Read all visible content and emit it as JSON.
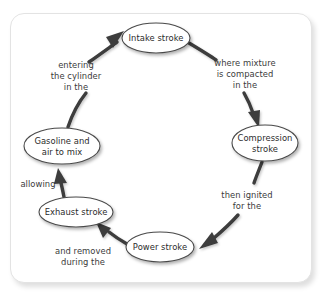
{
  "diagram": {
    "frame": {
      "border_color": "#e3e3e3",
      "background": "#ffffff"
    },
    "style": {
      "node_stroke": "#4a4a4a",
      "node_fill": "#ffffff",
      "arrow_color": "#3c3c3c",
      "text_color": "#2b2b2b"
    },
    "nodes": [
      {
        "id": "intake",
        "label_lines": [
          "Intake stroke"
        ],
        "line1": "Intake stroke",
        "line2": "",
        "cx": 156,
        "cy": 38,
        "rx": 34,
        "ry": 15
      },
      {
        "id": "compression",
        "label_lines": [
          "Compression",
          "stroke"
        ],
        "line1": "Compression",
        "line2": "stroke",
        "cx": 265,
        "cy": 143,
        "rx": 33,
        "ry": 18
      },
      {
        "id": "power",
        "label_lines": [
          "Power stroke"
        ],
        "line1": "Power stroke",
        "line2": "",
        "cx": 160,
        "cy": 247,
        "rx": 34,
        "ry": 15
      },
      {
        "id": "exhaust",
        "label_lines": [
          "Exhaust stroke"
        ],
        "line1": "Exhaust stroke",
        "line2": "",
        "cx": 76,
        "cy": 212,
        "rx": 37,
        "ry": 15
      },
      {
        "id": "gasoline",
        "label_lines": [
          "Gasoline and",
          "air to mix"
        ],
        "line1": "Gasoline and",
        "line2": "air to mix",
        "cx": 62,
        "cy": 146,
        "rx": 38,
        "ry": 18
      }
    ],
    "edges": [
      {
        "id": "gasoline-to-intake",
        "from": "gasoline",
        "to": "intake",
        "line1": "entering",
        "line2": "the cylinder",
        "line3": "in the",
        "label_x": 76,
        "label_y": 68
      },
      {
        "id": "intake-to-compression",
        "from": "intake",
        "to": "compression",
        "line1": "where mixture",
        "line2": "is compacted",
        "line3": "in the",
        "label_x": 245,
        "label_y": 66
      },
      {
        "id": "compression-to-power",
        "from": "compression",
        "to": "power",
        "line1": "then ignited",
        "line2": "for the",
        "line3": "",
        "label_x": 247,
        "label_y": 198
      },
      {
        "id": "power-to-exhaust",
        "from": "power",
        "to": "exhaust",
        "line1": "and removed",
        "line2": "during the",
        "line3": "",
        "label_x": 83,
        "label_y": 254
      },
      {
        "id": "exhaust-to-gasoline",
        "from": "exhaust",
        "to": "gasoline",
        "line1": "allowing",
        "line2": "",
        "line3": "",
        "label_x": 38,
        "label_y": 187
      }
    ]
  }
}
